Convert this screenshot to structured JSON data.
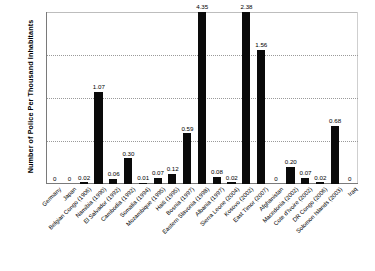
{
  "chart_data": {
    "type": "bar",
    "title": "",
    "xlabel": "",
    "ylabel": "Number of Police Per Thousand Inhabitants",
    "ylim": [
      0.0,
      2.0
    ],
    "yticks": [
      "0.00",
      "0.50",
      "1.00",
      "1.50",
      "2.00"
    ],
    "grid": true,
    "legend": "none",
    "note": "Bars for Eastern Slavonia (4.35) and Kosovo (2.38) exceed the 2.00 axis maximum and are drawn clipped at the top of the plot area.",
    "categories": [
      "Germany",
      "Japan",
      "Belgian Congo (1906)",
      "Namibia (1990)",
      "El Salvador (1992)",
      "Cambodia (1992)",
      "Somalia (1994)",
      "Mozambique (1995)",
      "Haiti (1995)",
      "Bosnia (1997)",
      "Eastern Slavonia (1998)",
      "Albania (1997)",
      "Sierra Leone (2004)",
      "Kosovo (2002)",
      "East Timor (2007)",
      "Afghanistan",
      "Macedonia (2002)",
      "Cote d'Ivoire (2002)",
      "DR Congo (2006)",
      "Solomon Islands (2003)",
      "Iraq"
    ],
    "values": [
      0,
      0,
      0.02,
      1.07,
      0.06,
      0.3,
      0.01,
      0.07,
      0.12,
      0.59,
      4.35,
      0.08,
      0.02,
      2.38,
      1.56,
      0,
      0.2,
      0.07,
      0.02,
      0.68,
      0
    ],
    "data_labels": [
      "0",
      "0",
      "0.02",
      "1.07",
      "0.06",
      "0.30",
      "0.01",
      "0.07",
      "0.12",
      "0.59",
      "4.35",
      "0.08",
      "0.02",
      "2.38",
      "1.56",
      "0",
      "0.20",
      "0.07",
      "0.02",
      "0.68",
      "0"
    ],
    "bar_color": "#0a0a0a"
  }
}
